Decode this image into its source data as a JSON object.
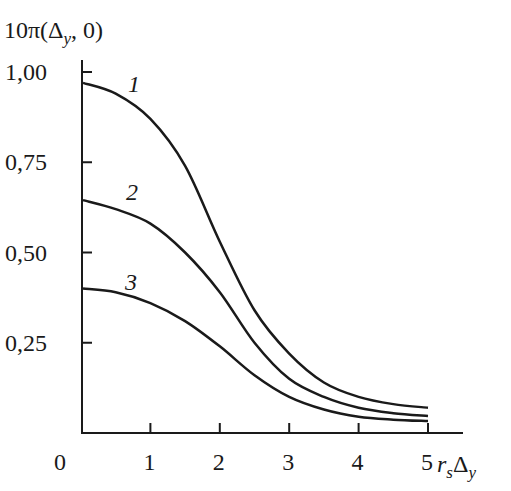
{
  "chart_data": {
    "type": "line",
    "title": "",
    "ylabel": "10π(Δy, 0)",
    "xlabel": "r_sΔ_y",
    "xlim": [
      0,
      5
    ],
    "ylim": [
      0,
      1.0
    ],
    "x_ticks": [
      "0",
      "1",
      "2",
      "3",
      "4",
      "5"
    ],
    "y_ticks": [
      "0,25",
      "0,50",
      "0,75",
      "1,00"
    ],
    "grid": false,
    "legend": "inline curve labels",
    "x": [
      0,
      0.5,
      1,
      1.5,
      2,
      2.5,
      3,
      3.5,
      4,
      4.5,
      5
    ],
    "series": [
      {
        "name": "1",
        "values": [
          0.97,
          0.94,
          0.87,
          0.74,
          0.53,
          0.34,
          0.22,
          0.14,
          0.1,
          0.08,
          0.07
        ]
      },
      {
        "name": "2",
        "values": [
          0.645,
          0.62,
          0.58,
          0.5,
          0.39,
          0.25,
          0.15,
          0.1,
          0.07,
          0.055,
          0.047
        ]
      },
      {
        "name": "3",
        "values": [
          0.4,
          0.39,
          0.36,
          0.31,
          0.24,
          0.16,
          0.1,
          0.065,
          0.045,
          0.037,
          0.033
        ]
      }
    ]
  },
  "labels": {
    "y_title_main": "10π(Δ",
    "y_title_sub": "y",
    "y_title_end": ", 0)",
    "x_title_r": "r",
    "x_title_s": "s",
    "x_title_delta": "Δ",
    "x_title_y": "y",
    "origin": "0"
  }
}
